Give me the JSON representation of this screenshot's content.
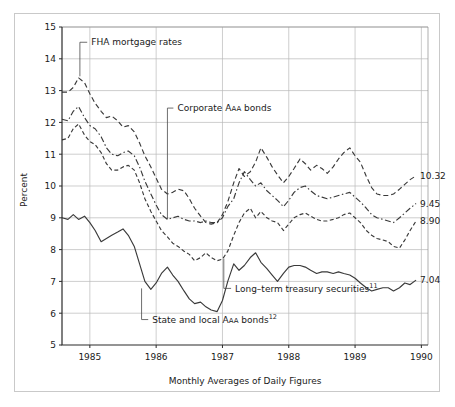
{
  "chart_data": {
    "type": "line",
    "title": "",
    "xlabel": "Monthly Averages of Daily Figures",
    "ylabel": "Percent",
    "ylim": [
      5,
      15
    ],
    "xlim": [
      1984.58,
      1990.1
    ],
    "ytick_labels": [
      "5",
      "6",
      "7",
      "8",
      "9",
      "10",
      "11",
      "12",
      "13",
      "14",
      "15"
    ],
    "ytick_values": [
      5,
      6,
      7,
      8,
      9,
      10,
      11,
      12,
      13,
      14,
      15
    ],
    "xtick_labels": [
      "1985",
      "1986",
      "1987",
      "1988",
      "1989",
      "1990"
    ],
    "xtick_values": [
      1985,
      1986,
      1987,
      1988,
      1989,
      1990
    ],
    "grid": "horizontal-and-vertical",
    "legend": "inline-annotations",
    "series": [
      {
        "name": "FHA mortgage rates",
        "dash": "5,3",
        "end_value": 10.32,
        "end_label": "10.32",
        "x": [
          1984.58,
          1984.67,
          1984.75,
          1984.83,
          1984.92,
          1985.0,
          1985.08,
          1985.17,
          1985.25,
          1985.33,
          1985.42,
          1985.5,
          1985.58,
          1985.67,
          1985.75,
          1985.83,
          1985.92,
          1986.0,
          1986.08,
          1986.17,
          1986.25,
          1986.33,
          1986.42,
          1986.5,
          1986.58,
          1986.67,
          1986.75,
          1986.83,
          1986.92,
          1987.0,
          1987.08,
          1987.17,
          1987.25,
          1987.33,
          1987.42,
          1987.5,
          1987.58,
          1987.67,
          1987.75,
          1987.83,
          1987.92,
          1988.0,
          1988.08,
          1988.17,
          1988.25,
          1988.33,
          1988.42,
          1988.5,
          1988.58,
          1988.67,
          1988.75,
          1988.83,
          1988.92,
          1989.0,
          1989.08,
          1989.17,
          1989.25,
          1989.33,
          1989.42,
          1989.5,
          1989.58,
          1989.67,
          1989.75,
          1989.83,
          1989.92
        ],
        "y": [
          12.95,
          12.95,
          13.1,
          13.4,
          13.25,
          12.9,
          12.6,
          12.35,
          12.15,
          12.2,
          12.05,
          11.85,
          11.9,
          11.7,
          11.35,
          10.95,
          10.6,
          10.25,
          9.9,
          9.75,
          9.8,
          9.9,
          9.85,
          9.6,
          9.3,
          9.05,
          8.85,
          8.8,
          8.85,
          9.1,
          9.5,
          10.1,
          10.55,
          10.3,
          10.45,
          10.75,
          11.2,
          10.9,
          10.6,
          10.35,
          10.1,
          10.3,
          10.55,
          10.85,
          10.7,
          10.5,
          10.65,
          10.55,
          10.4,
          10.6,
          10.85,
          11.05,
          11.2,
          10.95,
          10.75,
          10.3,
          9.95,
          9.75,
          9.7,
          9.7,
          9.75,
          9.9,
          10.05,
          10.2,
          10.32
        ]
      },
      {
        "name": "Corporate Aaa bonds",
        "dash": "6,2.5,1.5,2.5",
        "end_value": 9.45,
        "end_label": "9.45",
        "x": [
          1984.58,
          1984.67,
          1984.75,
          1984.83,
          1984.92,
          1985.0,
          1985.08,
          1985.17,
          1985.25,
          1985.33,
          1985.42,
          1985.5,
          1985.58,
          1985.67,
          1985.75,
          1985.83,
          1985.92,
          1986.0,
          1986.08,
          1986.17,
          1986.25,
          1986.33,
          1986.42,
          1986.5,
          1986.58,
          1986.67,
          1986.75,
          1986.83,
          1986.92,
          1987.0,
          1987.08,
          1987.17,
          1987.25,
          1987.33,
          1987.42,
          1987.5,
          1987.58,
          1987.67,
          1987.75,
          1987.83,
          1987.92,
          1988.0,
          1988.08,
          1988.17,
          1988.25,
          1988.33,
          1988.42,
          1988.5,
          1988.58,
          1988.67,
          1988.75,
          1988.83,
          1988.92,
          1989.0,
          1989.08,
          1989.17,
          1989.25,
          1989.33,
          1989.42,
          1989.5,
          1989.58,
          1989.67,
          1989.75,
          1989.83,
          1989.92
        ],
        "y": [
          12.1,
          12.05,
          12.35,
          12.5,
          12.15,
          11.9,
          11.8,
          11.55,
          11.2,
          11.0,
          10.95,
          11.05,
          11.1,
          10.95,
          10.6,
          10.15,
          9.75,
          9.4,
          9.1,
          8.95,
          9.0,
          9.05,
          8.95,
          8.9,
          8.9,
          8.85,
          8.9,
          8.85,
          8.85,
          9.0,
          9.35,
          9.6,
          10.1,
          10.45,
          10.2,
          10.0,
          10.1,
          9.85,
          9.7,
          9.55,
          9.35,
          9.55,
          9.8,
          9.95,
          10.0,
          9.85,
          9.7,
          9.65,
          9.6,
          9.65,
          9.7,
          9.75,
          9.8,
          9.65,
          9.5,
          9.3,
          9.1,
          9.0,
          8.95,
          8.9,
          8.85,
          9.0,
          9.15,
          9.3,
          9.45
        ]
      },
      {
        "name": "Long-term treasury securities",
        "dash": "4,2.5",
        "end_value": 8.9,
        "end_label": "8.90",
        "x": [
          1984.58,
          1984.67,
          1984.75,
          1984.83,
          1984.92,
          1985.0,
          1985.08,
          1985.17,
          1985.25,
          1985.33,
          1985.42,
          1985.5,
          1985.58,
          1985.67,
          1985.75,
          1985.83,
          1985.92,
          1986.0,
          1986.08,
          1986.17,
          1986.25,
          1986.33,
          1986.42,
          1986.5,
          1986.58,
          1986.67,
          1986.75,
          1986.83,
          1986.92,
          1987.0,
          1987.08,
          1987.17,
          1987.25,
          1987.33,
          1987.42,
          1987.5,
          1987.58,
          1987.67,
          1987.75,
          1987.83,
          1987.92,
          1988.0,
          1988.08,
          1988.17,
          1988.25,
          1988.33,
          1988.42,
          1988.5,
          1988.58,
          1988.67,
          1988.75,
          1988.83,
          1988.92,
          1989.0,
          1989.08,
          1989.17,
          1989.25,
          1989.33,
          1989.42,
          1989.5,
          1989.58,
          1989.67,
          1989.75,
          1989.83,
          1989.92
        ],
        "y": [
          11.45,
          11.5,
          11.8,
          11.95,
          11.6,
          11.4,
          11.3,
          11.05,
          10.7,
          10.5,
          10.5,
          10.6,
          10.65,
          10.5,
          10.1,
          9.6,
          9.2,
          8.9,
          8.6,
          8.4,
          8.2,
          8.1,
          7.95,
          7.85,
          7.65,
          7.75,
          7.9,
          7.75,
          7.65,
          7.7,
          7.95,
          8.45,
          8.85,
          9.15,
          9.3,
          9.0,
          9.2,
          9.0,
          8.9,
          8.85,
          8.6,
          8.8,
          9.0,
          9.1,
          9.15,
          9.05,
          8.95,
          8.9,
          8.9,
          8.95,
          9.0,
          9.1,
          9.15,
          9.0,
          8.85,
          8.6,
          8.45,
          8.35,
          8.3,
          8.25,
          8.1,
          8.05,
          8.3,
          8.6,
          8.9
        ]
      },
      {
        "name": "State and local Aaa bonds",
        "dash": "none",
        "end_value": 7.04,
        "end_label": "7.04",
        "x": [
          1984.58,
          1984.67,
          1984.75,
          1984.83,
          1984.92,
          1985.0,
          1985.08,
          1985.17,
          1985.25,
          1985.33,
          1985.42,
          1985.5,
          1985.58,
          1985.67,
          1985.75,
          1985.83,
          1985.92,
          1986.0,
          1986.08,
          1986.17,
          1986.25,
          1986.33,
          1986.42,
          1986.5,
          1986.58,
          1986.67,
          1986.75,
          1986.83,
          1986.92,
          1987.0,
          1987.08,
          1987.17,
          1987.25,
          1987.33,
          1987.42,
          1987.5,
          1987.58,
          1987.67,
          1987.75,
          1987.83,
          1987.92,
          1988.0,
          1988.08,
          1988.17,
          1988.25,
          1988.33,
          1988.42,
          1988.5,
          1988.58,
          1988.67,
          1988.75,
          1988.83,
          1988.92,
          1989.0,
          1989.08,
          1989.17,
          1989.25,
          1989.33,
          1989.42,
          1989.5,
          1989.58,
          1989.67,
          1989.75,
          1989.83,
          1989.92
        ],
        "y": [
          9.0,
          8.95,
          9.1,
          8.95,
          9.05,
          8.85,
          8.6,
          8.25,
          8.35,
          8.45,
          8.55,
          8.65,
          8.45,
          8.1,
          7.55,
          7.0,
          6.75,
          6.95,
          7.25,
          7.45,
          7.2,
          7.0,
          6.7,
          6.45,
          6.3,
          6.35,
          6.2,
          6.1,
          6.05,
          6.4,
          7.0,
          7.55,
          7.35,
          7.5,
          7.75,
          7.9,
          7.6,
          7.4,
          7.2,
          7.0,
          7.25,
          7.45,
          7.5,
          7.5,
          7.45,
          7.35,
          7.25,
          7.3,
          7.3,
          7.25,
          7.3,
          7.25,
          7.2,
          7.1,
          6.95,
          6.8,
          6.7,
          6.75,
          6.8,
          6.8,
          6.7,
          6.8,
          6.95,
          6.9,
          7.04
        ]
      }
    ],
    "annotations": [
      {
        "text": "FHA mortgage rates",
        "sup": "",
        "x": 1984.93,
        "y": 14.52,
        "anchor": "start",
        "leader_to_x": 1984.85,
        "leader_to_y": 13.45
      },
      {
        "text": "Corporate A",
        "smallcaps": "AA",
        "tail": " bonds",
        "sup": "",
        "x": 1986.23,
        "y": 12.45,
        "anchor": "start",
        "leader_to_x": 1986.17,
        "leader_to_y": 8.95
      },
      {
        "text": "Long–term treasury securities",
        "sup": "11",
        "x": 1987.1,
        "y": 6.78,
        "anchor": "start",
        "leader_to_x": 1987.02,
        "leader_to_y": 7.72
      },
      {
        "text": "State and local A",
        "smallcaps": "AA",
        "tail": " bonds",
        "sup": "12",
        "x": 1985.85,
        "y": 5.8,
        "anchor": "start",
        "leader_to_x": 1985.78,
        "leader_to_y": 6.78
      }
    ]
  },
  "figure": {
    "ylabel": "Percent",
    "xlabel": "Monthly Averages of Daily Figures"
  }
}
